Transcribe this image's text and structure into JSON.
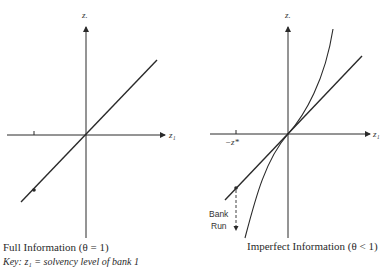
{
  "left_panel": {
    "caption": "Full Information (θ = 1)",
    "x_axis_label": "z₁",
    "y_axis_label": "z.",
    "key": "Key: z₁ = solvency level of bank 1"
  },
  "right_panel": {
    "caption": "Imperfect Information (θ < 1)",
    "x_axis_label": "z₁",
    "y_axis_label": "z.",
    "tick_label": "−z*",
    "annotation_line1": "Bank",
    "annotation_line2": "Run"
  },
  "colors": {
    "ink": "#2a2a2a",
    "background": "#ffffff"
  }
}
